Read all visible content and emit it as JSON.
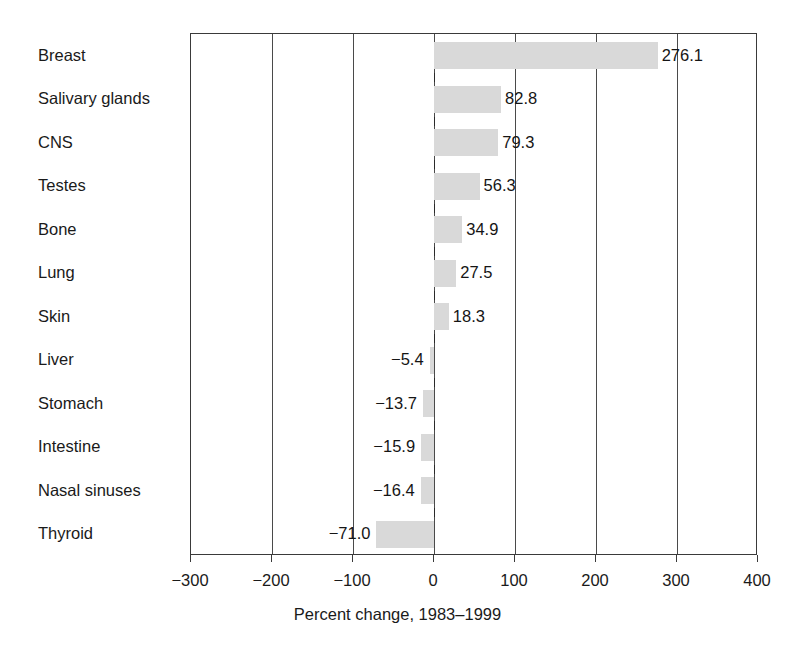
{
  "chart_data": {
    "type": "bar",
    "orientation": "horizontal",
    "title": "",
    "xlabel": "Percent change, 1983–1999",
    "ylabel": "",
    "xlim": [
      -300,
      400
    ],
    "xticks": [
      -300,
      -200,
      -100,
      0,
      100,
      200,
      300,
      400
    ],
    "xtick_labels": [
      "−300",
      "−200",
      "−100",
      "0",
      "100",
      "200",
      "300",
      "400"
    ],
    "grid": true,
    "grid_axis": "x",
    "legend": null,
    "bar_color": "#d9d9d9",
    "categories": [
      "Breast",
      "Salivary glands",
      "CNS",
      "Testes",
      "Bone",
      "Lung",
      "Skin",
      "Liver",
      "Stomach",
      "Intestine",
      "Nasal sinuses",
      "Thyroid"
    ],
    "values": [
      276.1,
      82.8,
      79.3,
      56.3,
      34.9,
      27.5,
      18.3,
      -5.4,
      -13.7,
      -15.9,
      -16.4,
      -71.0
    ],
    "value_labels": [
      "276.1",
      "82.8",
      "79.3",
      "56.3",
      "34.9",
      "27.5",
      "18.3",
      "−5.4",
      "−13.7",
      "−15.9",
      "−16.4",
      "−71.0"
    ],
    "bars": [
      {
        "category": "Breast",
        "value": 276.1,
        "label": "276.1"
      },
      {
        "category": "Salivary glands",
        "value": 82.8,
        "label": "82.8"
      },
      {
        "category": "CNS",
        "value": 79.3,
        "label": "79.3"
      },
      {
        "category": "Testes",
        "value": 56.3,
        "label": "56.3"
      },
      {
        "category": "Bone",
        "value": 34.9,
        "label": "34.9"
      },
      {
        "category": "Lung",
        "value": 27.5,
        "label": "27.5"
      },
      {
        "category": "Skin",
        "value": 18.3,
        "label": "18.3"
      },
      {
        "category": "Liver",
        "value": -5.4,
        "label": "−5.4"
      },
      {
        "category": "Stomach",
        "value": -13.7,
        "label": "−13.7"
      },
      {
        "category": "Intestine",
        "value": -15.9,
        "label": "−15.9"
      },
      {
        "category": "Nasal sinuses",
        "value": -16.4,
        "label": "−16.4"
      },
      {
        "category": "Thyroid",
        "value": -71.0,
        "label": "−71.0"
      }
    ]
  }
}
